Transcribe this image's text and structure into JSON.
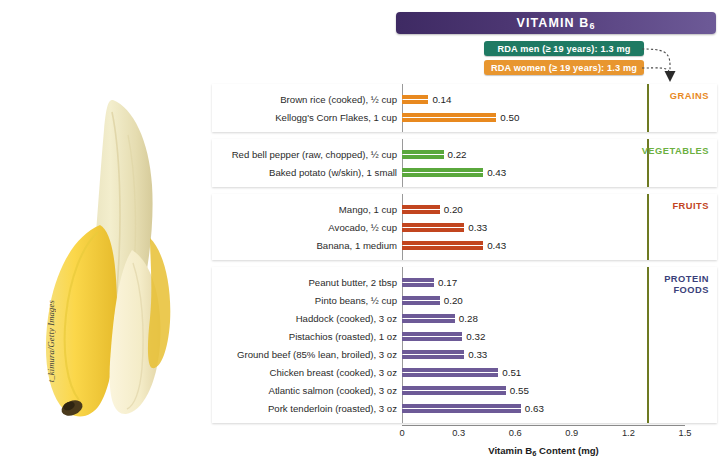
{
  "title": {
    "text": "VITAMIN B",
    "sub": "6"
  },
  "rda": [
    {
      "name": "rda-men",
      "label": "RDA men (≥ 19 years): 1.3 mg",
      "color": "#1f7a63",
      "value": 1.3
    },
    {
      "name": "rda-women",
      "label": "RDA women (≥ 19 years): 1.3 mg",
      "color": "#e8962f",
      "value": 1.3
    }
  ],
  "photo": {
    "credit": "t_kimura/Getty Images",
    "subject": "peeled banana"
  },
  "axis": {
    "ticks": [
      "0",
      "0.3",
      "0.6",
      "0.9",
      "1.2",
      "1.5"
    ],
    "tick_values": [
      0,
      0.3,
      0.6,
      0.9,
      1.2,
      1.5
    ],
    "title": "Vitamin B",
    "title_sub": "6",
    "title_tail": " Content (mg)",
    "rda_line_value": 1.3,
    "rda_line_color": "#6e7a22"
  },
  "chart_data": {
    "type": "bar",
    "orientation": "horizontal",
    "title": "VITAMIN B6",
    "xlabel": "Vitamin B6 Content (mg)",
    "ylabel": "",
    "xlim": [
      0,
      1.5
    ],
    "grid": false,
    "legend": "none",
    "reference_lines": [
      {
        "label": "RDA men (≥ 19 years): 1.3 mg",
        "value": 1.3
      },
      {
        "label": "RDA women (≥ 19 years): 1.3 mg",
        "value": 1.3
      }
    ],
    "groups": [
      {
        "category": "GRAINS",
        "color": "#e8891f",
        "label_color": "#e8891f",
        "categories": [
          "Brown rice  (cooked), ½ cup",
          "Kellogg's Corn Flakes, 1 cup"
        ],
        "values": [
          0.14,
          0.5
        ],
        "value_labels": [
          "0.14",
          "0.50"
        ]
      },
      {
        "category": "VEGETABLES",
        "color": "#5aa83c",
        "label_color": "#6cb03f",
        "categories": [
          "Red bell pepper (raw, chopped), ½ cup",
          "Baked potato (w/skin), 1 small"
        ],
        "values": [
          0.22,
          0.43
        ],
        "value_labels": [
          "0.22",
          "0.43"
        ]
      },
      {
        "category": "FRUITS",
        "color": "#c2451f",
        "label_color": "#c2451f",
        "categories": [
          "Mango, 1 cup",
          "Avocado, ½ cup",
          "Banana, 1 medium"
        ],
        "values": [
          0.2,
          0.33,
          0.43
        ],
        "value_labels": [
          "0.20",
          "0.33",
          "0.43"
        ]
      },
      {
        "category": "PROTEIN FOODS",
        "color": "#6d5a97",
        "label_color": "#3b3f7a",
        "categories": [
          "Peanut butter, 2 tbsp",
          "Pinto beans, ½ cup",
          "Haddock (cooked), 3 oz",
          "Pistachios (roasted), 1 oz",
          "Ground beef (85% lean, broiled), 3 oz",
          "Chicken breast (cooked), 3 oz",
          "Atlantic salmon (cooked), 3 oz",
          "Pork tenderloin (roasted), 3 oz"
        ],
        "values": [
          0.17,
          0.2,
          0.28,
          0.32,
          0.33,
          0.51,
          0.55,
          0.63
        ],
        "value_labels": [
          "0.17",
          "0.20",
          "0.28",
          "0.32",
          "0.33",
          "0.51",
          "0.55",
          "0.63"
        ]
      }
    ]
  }
}
